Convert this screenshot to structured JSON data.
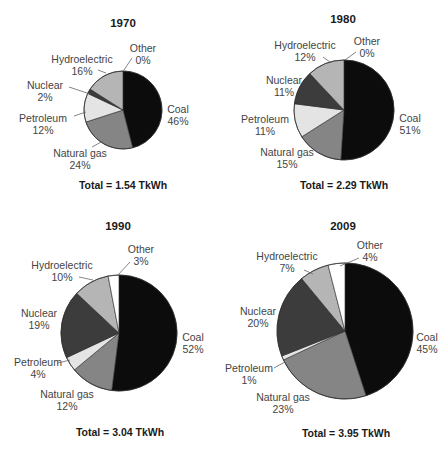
{
  "chart_data": [
    {
      "type": "pie",
      "title": "1970",
      "total_label": "Total = 1.54 TkWh",
      "total_value": 1.54,
      "unit": "TkWh",
      "categories": [
        "Coal",
        "Natural gas",
        "Petroleum",
        "Nuclear",
        "Hydroelectric",
        "Other"
      ],
      "values": [
        46,
        24,
        12,
        2,
        16,
        0
      ],
      "value_labels": [
        "46%",
        "24%",
        "12%",
        "2%",
        "16%",
        "0%"
      ],
      "layout": {
        "cx": 123,
        "cy": 110,
        "r": 39,
        "title_x": 123,
        "title_y": 27,
        "total_x": 123,
        "total_y": 189,
        "labels": [
          {
            "x": 178,
            "y": 113,
            "anchor": "middle",
            "lx1": null
          },
          {
            "x": 80,
            "y": 157,
            "anchor": "middle",
            "lx1": 92,
            "ly1": 147,
            "lx2": 103,
            "ly2": 141
          },
          {
            "x": 43,
            "y": 122,
            "anchor": "middle",
            "lx1": 74,
            "ly1": 116,
            "lx2": 86,
            "ly2": 112
          },
          {
            "x": 45,
            "y": 89,
            "anchor": "middle",
            "lx1": 69,
            "ly1": 87,
            "lx2": 90,
            "ly2": 94
          },
          {
            "x": 82,
            "y": 63,
            "anchor": "middle",
            "lx1": 98,
            "ly1": 70,
            "lx2": 106,
            "ly2": 73
          },
          {
            "x": 143,
            "y": 52,
            "anchor": "middle",
            "lx1": 132,
            "ly1": 58,
            "lx2": 124,
            "ly2": 70
          }
        ]
      }
    },
    {
      "type": "pie",
      "title": "1980",
      "total_label": "Total = 2.29 TkWh",
      "total_value": 2.29,
      "unit": "TkWh",
      "categories": [
        "Coal",
        "Natural gas",
        "Petroleum",
        "Nuclear",
        "Hydroelectric",
        "Other"
      ],
      "values": [
        51,
        15,
        11,
        11,
        12,
        0
      ],
      "value_labels": [
        "51%",
        "15%",
        "11%",
        "11%",
        "12%",
        "0%"
      ],
      "layout": {
        "cx": 344,
        "cy": 110,
        "r": 50,
        "title_x": 343,
        "title_y": 23,
        "total_x": 344,
        "total_y": 189,
        "labels": [
          {
            "x": 410,
            "y": 122,
            "anchor": "middle",
            "lx1": null
          },
          {
            "x": 287,
            "y": 156,
            "anchor": "middle",
            "lx1": null
          },
          {
            "x": 265,
            "y": 123,
            "anchor": "middle",
            "lx1": null
          },
          {
            "x": 284,
            "y": 84,
            "anchor": "middle",
            "lx1": null
          },
          {
            "x": 305,
            "y": 49,
            "anchor": "middle",
            "lx1": 323,
            "ly1": 57,
            "lx2": 330,
            "ly2": 62
          },
          {
            "x": 367,
            "y": 45,
            "anchor": "middle",
            "lx1": 356,
            "ly1": 52,
            "lx2": 345,
            "ly2": 60
          }
        ]
      }
    },
    {
      "type": "pie",
      "title": "1990",
      "total_label": "Total = 3.04 TkWh",
      "total_value": 3.04,
      "unit": "TkWh",
      "categories": [
        "Coal",
        "Natural gas",
        "Petroleum",
        "Nuclear",
        "Hydroelectric",
        "Other"
      ],
      "values": [
        52,
        12,
        4,
        19,
        10,
        3
      ],
      "value_labels": [
        "52%",
        "12%",
        "4%",
        "19%",
        "10%",
        "3%"
      ],
      "layout": {
        "cx": 119,
        "cy": 333,
        "r": 58,
        "title_x": 118,
        "title_y": 230,
        "total_x": 120,
        "total_y": 436,
        "labels": [
          {
            "x": 193,
            "y": 341,
            "anchor": "middle",
            "lx1": null
          },
          {
            "x": 67,
            "y": 398,
            "anchor": "middle",
            "lx1": null
          },
          {
            "x": 38,
            "y": 366,
            "anchor": "middle",
            "lx1": 58,
            "ly1": 363,
            "lx2": 70,
            "ly2": 360
          },
          {
            "x": 39,
            "y": 317,
            "anchor": "middle",
            "lx1": null
          },
          {
            "x": 62,
            "y": 269,
            "anchor": "middle",
            "lx1": 79,
            "ly1": 277,
            "lx2": 93,
            "ly2": 280
          },
          {
            "x": 141,
            "y": 253,
            "anchor": "middle",
            "lx1": 130,
            "ly1": 262,
            "lx2": 117,
            "ly2": 276
          }
        ]
      }
    },
    {
      "type": "pie",
      "title": "2009",
      "total_label": "Total = 3.95 TkWh",
      "total_value": 3.95,
      "unit": "TkWh",
      "categories": [
        "Coal",
        "Natural gas",
        "Petroleum",
        "Nuclear",
        "Hydroelectric",
        "Other"
      ],
      "values": [
        45,
        23,
        1,
        20,
        7,
        4
      ],
      "value_labels": [
        "45%",
        "23%",
        "1%",
        "20%",
        "7%",
        "4%"
      ],
      "layout": {
        "cx": 345,
        "cy": 331,
        "r": 68,
        "title_x": 343,
        "title_y": 230,
        "total_x": 346,
        "total_y": 437,
        "labels": [
          {
            "x": 427,
            "y": 341,
            "anchor": "middle",
            "lx1": null
          },
          {
            "x": 283,
            "y": 401,
            "anchor": "middle",
            "lx1": null
          },
          {
            "x": 249,
            "y": 372,
            "anchor": "middle",
            "lx1": 274,
            "ly1": 368,
            "lx2": 285,
            "ly2": 362
          },
          {
            "x": 258,
            "y": 315,
            "anchor": "middle",
            "lx1": null
          },
          {
            "x": 287,
            "y": 260,
            "anchor": "middle",
            "lx1": 304,
            "ly1": 270,
            "lx2": 313,
            "ly2": 274
          },
          {
            "x": 370,
            "y": 249,
            "anchor": "middle",
            "lx1": 359,
            "ly1": 258,
            "lx2": 340,
            "ly2": 266
          }
        ]
      }
    }
  ],
  "colors": {
    "Coal": "#0c0c0c",
    "Natural gas": "#858585",
    "Petroleum": "#e4e4e4",
    "Nuclear": "#3c3c3c",
    "Hydroelectric": "#b5b5b5",
    "Other": "#ffffff"
  },
  "start_angle_deg": 0,
  "direction": "clockwise"
}
